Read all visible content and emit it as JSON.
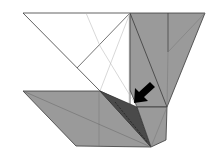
{
  "diagram": {
    "type": "origami-step",
    "colors": {
      "paper_white": "#ffffff",
      "paper_colored": "#9a9a9a",
      "paper_dark": "#4a4a4a",
      "edge": "#3a3a3a",
      "crease": "#b0b0b0",
      "arrow": "#000000"
    },
    "annotations": {
      "arrow": "push / sink arrow pointing down-left into the fold"
    }
  }
}
